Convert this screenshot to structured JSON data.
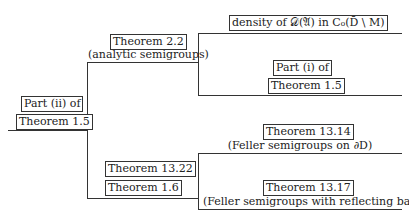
{
  "root": {
    "line1": "Part (ii) of",
    "line2": "Theorem 1.5"
  },
  "upper_branch": {
    "label": "Theorem 2.2",
    "caption": "(analytic semigroups)",
    "leaves": [
      {
        "label": "density of 𝒟(𝔄) in C₀(D̄ \\ M)"
      },
      {
        "line1": "Part (i) of",
        "line2": "Theorem 1.5"
      }
    ]
  },
  "lower_branch": {
    "line1": "Theorem 13.22",
    "line2": "Theorem 1.6",
    "leaves": [
      {
        "label": "Theorem 13.14",
        "caption": "(Feller semigroups on ∂D)"
      },
      {
        "label": "Theorem 13.17",
        "caption": "(Feller semigroups with reflecting barrier)"
      }
    ]
  }
}
